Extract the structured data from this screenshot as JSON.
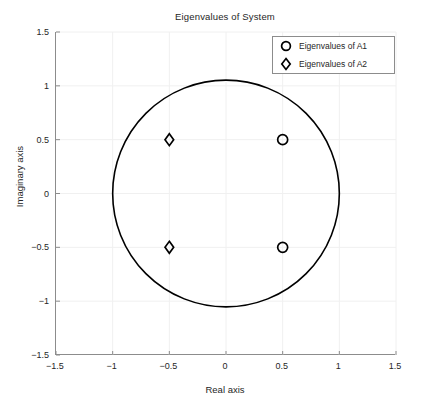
{
  "chart_data": {
    "type": "scatter",
    "title": "Eigenvalues of System",
    "xlabel": "Real axis",
    "ylabel": "Imaginary axis",
    "xlim": [
      -1.5,
      1.5
    ],
    "ylim": [
      -1.5,
      1.5
    ],
    "xticks": [
      "-1.5",
      "-1",
      "-0.5",
      "0",
      "0.5",
      "1",
      "1.5"
    ],
    "xtick_values": [
      -1.5,
      -1,
      -0.5,
      0,
      0.5,
      1,
      1.5
    ],
    "yticks": [
      "-1.5",
      "-1",
      "-0.5",
      "0",
      "0.5",
      "1",
      "1.5"
    ],
    "ytick_values": [
      -1.5,
      -1,
      -0.5,
      0,
      0.5,
      1,
      1.5
    ],
    "grid": true,
    "legend_position": "top-right",
    "series": [
      {
        "name": "Eigenvalues of A1",
        "marker": "circle",
        "color": "#000000",
        "points": [
          {
            "x": 0.5,
            "y": 0.5
          },
          {
            "x": 0.5,
            "y": -0.5
          }
        ]
      },
      {
        "name": "Eigenvalues of A2",
        "marker": "diamond",
        "color": "#000000",
        "points": [
          {
            "x": -0.5,
            "y": 0.5
          },
          {
            "x": -0.5,
            "y": -0.5
          }
        ]
      }
    ],
    "reference_curve": {
      "name": "unit-circle",
      "type": "circle",
      "center": [
        0,
        0
      ],
      "radius": 1,
      "color": "#000000"
    },
    "annotations": []
  },
  "legend": {
    "entries": [
      {
        "label": "Eigenvalues of A1",
        "marker": "circle"
      },
      {
        "label": "Eigenvalues of A2",
        "marker": "diamond"
      }
    ]
  },
  "colors": {
    "axis": "#8c8c8c",
    "grid": "#f0f0f0",
    "text": "#262626",
    "data": "#000000"
  }
}
